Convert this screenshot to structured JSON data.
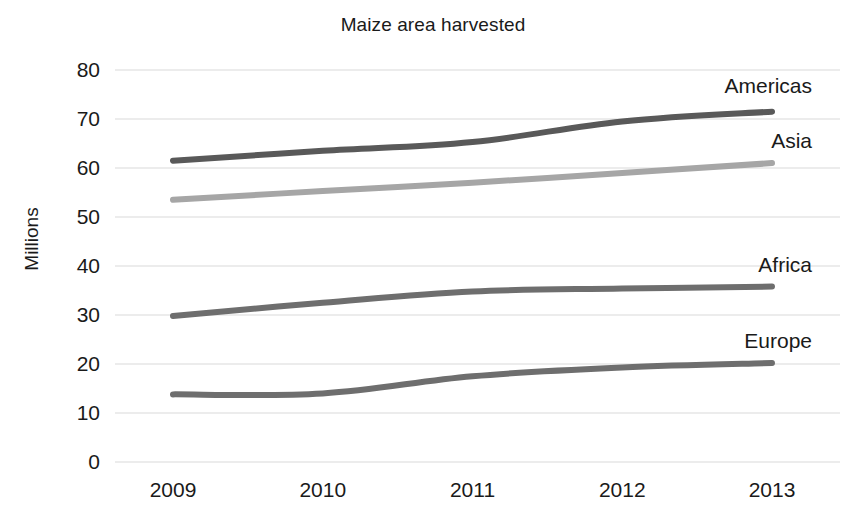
{
  "chart_data": {
    "type": "line",
    "title": "Maize area harvested",
    "xlabel": "",
    "ylabel": "Millions",
    "x": [
      "2009",
      "2010",
      "2011",
      "2012",
      "2013"
    ],
    "categories": [
      "2009",
      "2010",
      "2011",
      "2012",
      "2013"
    ],
    "ylim": [
      0,
      80
    ],
    "yticks": [
      "0",
      "10",
      "20",
      "30",
      "40",
      "50",
      "60",
      "70",
      "80"
    ],
    "ytick_values": [
      0,
      10,
      20,
      30,
      40,
      50,
      60,
      70,
      80
    ],
    "grid": "horizontal",
    "legend_position": "right-inline-labels",
    "series": [
      {
        "name": "Americas",
        "values": [
          61.5,
          63.5,
          65.3,
          69.5,
          71.5
        ],
        "color": "#595959"
      },
      {
        "name": "Asia",
        "values": [
          53.5,
          55.3,
          57.0,
          59.0,
          61.0
        ],
        "color": "#a6a6a6"
      },
      {
        "name": "Africa",
        "values": [
          29.8,
          32.5,
          34.8,
          35.4,
          35.8
        ],
        "color": "#6e6e6e"
      },
      {
        "name": "Europe",
        "values": [
          13.8,
          14.0,
          17.5,
          19.3,
          20.2
        ],
        "color": "#6e6e6e"
      }
    ]
  },
  "axis": {
    "y_title": "Millions"
  },
  "colors": {
    "gridline": "#d9d9d9",
    "text": "#1a1a1a",
    "background": "#ffffff"
  }
}
